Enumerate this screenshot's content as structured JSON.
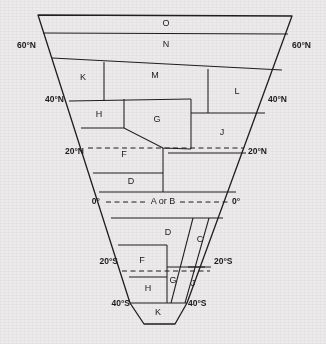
{
  "figure": {
    "background_color": "#eceaea",
    "line_color": "#1f1f1f"
  },
  "latitude_labels": [
    {
      "id": "lat-60n-left",
      "text": "60°N",
      "side": "left",
      "x": 36,
      "y": 46
    },
    {
      "id": "lat-60n-right",
      "text": "60°N",
      "side": "right",
      "x": 292,
      "y": 46
    },
    {
      "id": "lat-40n-left",
      "text": "40°N",
      "side": "left",
      "x": 64,
      "y": 100
    },
    {
      "id": "lat-40n-right",
      "text": "40°N",
      "side": "right",
      "x": 268,
      "y": 100
    },
    {
      "id": "lat-20n-left",
      "text": "20°N",
      "side": "left",
      "x": 84,
      "y": 152
    },
    {
      "id": "lat-20n-right",
      "text": "20°N",
      "side": "right",
      "x": 248,
      "y": 152
    },
    {
      "id": "lat-0-left",
      "text": "0°",
      "side": "left",
      "x": 100,
      "y": 202
    },
    {
      "id": "lat-0-right",
      "text": "0°",
      "side": "right",
      "x": 232,
      "y": 202
    },
    {
      "id": "lat-20s-left",
      "text": "20°S",
      "side": "left",
      "x": 118,
      "y": 262
    },
    {
      "id": "lat-20s-right",
      "text": "20°S",
      "side": "right",
      "x": 214,
      "y": 262
    },
    {
      "id": "lat-40s-left",
      "text": "40°S",
      "side": "left",
      "x": 130,
      "y": 304
    },
    {
      "id": "lat-40s-right",
      "text": "40°S",
      "side": "right",
      "x": 188,
      "y": 304
    }
  ],
  "equator_label": {
    "text": "A or B",
    "x": 163,
    "y": 202
  },
  "zones": [
    {
      "id": "zone-o",
      "label": "O",
      "x": 166,
      "y": 24
    },
    {
      "id": "zone-n",
      "label": "N",
      "x": 166,
      "y": 45
    },
    {
      "id": "zone-k-north",
      "label": "K",
      "x": 83,
      "y": 78
    },
    {
      "id": "zone-m",
      "label": "M",
      "x": 155,
      "y": 76
    },
    {
      "id": "zone-l",
      "label": "L",
      "x": 237,
      "y": 92
    },
    {
      "id": "zone-h-north",
      "label": "H",
      "x": 99,
      "y": 115
    },
    {
      "id": "zone-g-north",
      "label": "G",
      "x": 157,
      "y": 120
    },
    {
      "id": "zone-j-north",
      "label": "J",
      "x": 222,
      "y": 133
    },
    {
      "id": "zone-f-north",
      "label": "F",
      "x": 124,
      "y": 155
    },
    {
      "id": "zone-d-north",
      "label": "D",
      "x": 131,
      "y": 182
    },
    {
      "id": "zone-d-south",
      "label": "D",
      "x": 168,
      "y": 233
    },
    {
      "id": "zone-c",
      "label": "C",
      "x": 200,
      "y": 240
    },
    {
      "id": "zone-f-south",
      "label": "F",
      "x": 142,
      "y": 261
    },
    {
      "id": "zone-g-south",
      "label": "G",
      "x": 173,
      "y": 281
    },
    {
      "id": "zone-j-south",
      "label": "J",
      "x": 193,
      "y": 284
    },
    {
      "id": "zone-h-south",
      "label": "H",
      "x": 148,
      "y": 289
    },
    {
      "id": "zone-k-south",
      "label": "K",
      "x": 158,
      "y": 313
    }
  ]
}
